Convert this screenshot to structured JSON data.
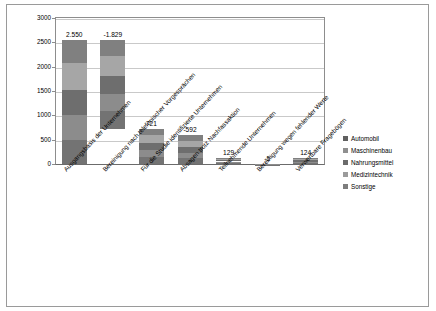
{
  "chart_data": {
    "type": "bar",
    "stacked": true,
    "title": "",
    "xlabel": "",
    "ylabel": "",
    "ylim": [
      0,
      3000
    ],
    "yticks": [
      0,
      500,
      1000,
      1500,
      2000,
      2500,
      3000
    ],
    "grid": true,
    "legend_position": "right",
    "categories": [
      "Ausgangsbasis der Unternehmen",
      "Bereinigung nach telefonischer Vorgesprächen",
      "Für die Studie identifizierte Unternehmen",
      "Absagen trotz Nachfassaktion",
      "Teilnehmende Unternehmen",
      "Bereinigung wegen fehlender Werte",
      "Verwertbare Fragebögen"
    ],
    "data_labels": [
      "2.550",
      "-1.829",
      "721",
      "-592",
      "129",
      "-5",
      "124"
    ],
    "totals": [
      2550,
      1829,
      721,
      592,
      129,
      5,
      124
    ],
    "bar_bases": [
      0,
      721,
      0,
      0,
      0,
      0,
      0
    ],
    "series": [
      {
        "name": "Automobil",
        "color": "#808080",
        "values": [
          470,
          340,
          130,
          110,
          24,
          1,
          23
        ]
      },
      {
        "name": "Maschinenbau",
        "color": "#a6a6a6",
        "values": [
          560,
          400,
          160,
          130,
          28,
          1,
          27
        ]
      },
      {
        "name": "Nahrungsmittel",
        "color": "#6e6e6e",
        "values": [
          520,
          370,
          145,
          120,
          26,
          1,
          25
        ]
      },
      {
        "name": "Medizintechnik",
        "color": "#8c8c8c",
        "values": [
          500,
          360,
          141,
          117,
          25,
          1,
          24
        ]
      },
      {
        "name": "Sonstige",
        "color": "#737373",
        "values": [
          500,
          359,
          145,
          115,
          26,
          1,
          25
        ]
      }
    ]
  },
  "legend": {
    "items": [
      {
        "label": "Automobil",
        "color": "#606060"
      },
      {
        "label": "Maschinenbau",
        "color": "#8f8f8f"
      },
      {
        "label": "Nahrungsmittel",
        "color": "#6b6b6b"
      },
      {
        "label": "Medizintechnik",
        "color": "#9b9b9b"
      },
      {
        "label": "Sonstige",
        "color": "#7d7d7d"
      }
    ]
  }
}
